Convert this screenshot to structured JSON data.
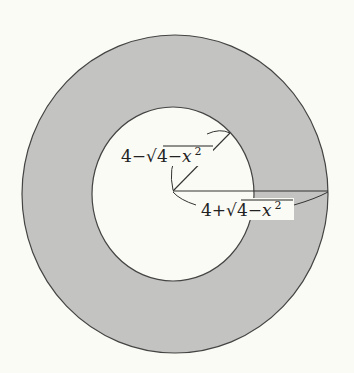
{
  "figure": {
    "colors": {
      "background": "#fbfbf5",
      "ring_fill": "#c3c3c1",
      "hole_fill": "#fbfbf5",
      "stroke": "#444444"
    },
    "inner_radius_label": {
      "prefix": "4−",
      "radical": "√",
      "radicand": "4−",
      "var": "x",
      "exp": "2"
    },
    "outer_radius_label": {
      "prefix": "4+",
      "radical": "√",
      "radicand": "4−",
      "var": "x",
      "exp": "2"
    }
  }
}
